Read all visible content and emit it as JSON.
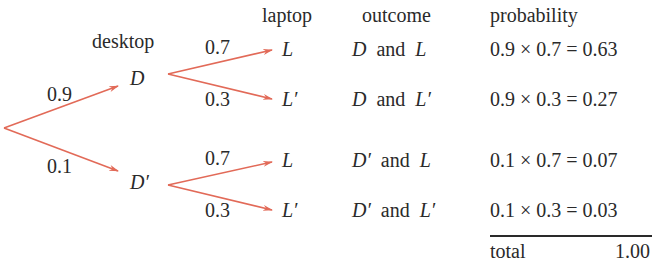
{
  "colors": {
    "arrow": "#e26a58",
    "text": "#2a2a2a",
    "background": "#ffffff"
  },
  "headers": {
    "desktop": "desktop",
    "laptop": "laptop",
    "outcome": "outcome",
    "probability": "probability"
  },
  "tree": {
    "first_level": {
      "nodes": [
        {
          "label": "D",
          "branch_prob": "0.9"
        },
        {
          "label": "D′",
          "branch_prob": "0.1"
        }
      ]
    },
    "second_level": {
      "groups": [
        {
          "parent": "D",
          "nodes": [
            {
              "label": "L",
              "branch_prob": "0.7"
            },
            {
              "label": "L′",
              "branch_prob": "0.3"
            }
          ]
        },
        {
          "parent": "D′",
          "nodes": [
            {
              "label": "L",
              "branch_prob": "0.7"
            },
            {
              "label": "L′",
              "branch_prob": "0.3"
            }
          ]
        }
      ]
    }
  },
  "outcomes": [
    {
      "a": "D",
      "conj": "and",
      "b": "L",
      "probability": "0.9 × 0.7 = 0.63"
    },
    {
      "a": "D",
      "conj": "and",
      "b": "L′",
      "probability": "0.9 × 0.3 = 0.27"
    },
    {
      "a": "D′",
      "conj": "and",
      "b": "L",
      "probability": "0.1 × 0.7 = 0.07"
    },
    {
      "a": "D′",
      "conj": "and",
      "b": "L′",
      "probability": "0.1 × 0.3 = 0.03"
    }
  ],
  "total": {
    "label": "total",
    "value": "1.00"
  }
}
